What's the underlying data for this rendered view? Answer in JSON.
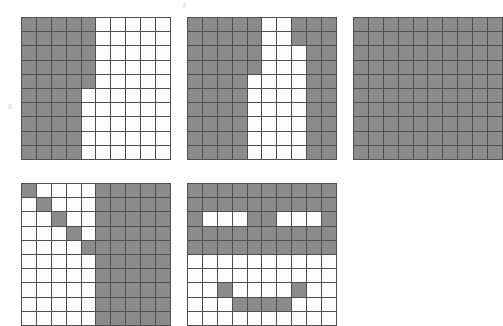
{
  "figure": {
    "background_color": "#ffffff",
    "filled_color": "#8b8b8b",
    "empty_color": "#fdfdfd",
    "gridline_color": "#4f4f4f",
    "grid_count": 5,
    "rows": 10,
    "cols": 10
  },
  "grids": [
    {
      "id": "grid-1",
      "name": "grid-top-left",
      "label": "Grid 1",
      "rows": 10,
      "cols": 10,
      "clipped": false,
      "position": {
        "left": 21,
        "top": 17,
        "width": 150,
        "height": 143
      },
      "cells": [
        [
          1,
          1,
          1,
          1,
          1,
          0,
          0,
          0,
          0,
          0
        ],
        [
          1,
          1,
          1,
          1,
          1,
          0,
          0,
          0,
          0,
          0
        ],
        [
          1,
          1,
          1,
          1,
          1,
          0,
          0,
          0,
          0,
          0
        ],
        [
          1,
          1,
          1,
          1,
          1,
          0,
          0,
          0,
          0,
          0
        ],
        [
          1,
          1,
          1,
          1,
          1,
          0,
          0,
          0,
          0,
          0
        ],
        [
          1,
          1,
          1,
          1,
          0,
          0,
          0,
          0,
          0,
          0
        ],
        [
          1,
          1,
          1,
          1,
          0,
          0,
          0,
          0,
          0,
          0
        ],
        [
          1,
          1,
          1,
          1,
          0,
          0,
          0,
          0,
          0,
          0
        ],
        [
          1,
          1,
          1,
          1,
          0,
          0,
          0,
          0,
          0,
          0
        ],
        [
          1,
          1,
          1,
          1,
          0,
          0,
          0,
          0,
          0,
          0
        ]
      ]
    },
    {
      "id": "grid-2",
      "name": "grid-top-middle",
      "label": "Grid 2",
      "rows": 10,
      "cols": 10,
      "clipped": false,
      "position": {
        "left": 187,
        "top": 17,
        "width": 150,
        "height": 143
      },
      "cells": [
        [
          1,
          1,
          1,
          1,
          1,
          0,
          0,
          1,
          1,
          1
        ],
        [
          1,
          1,
          1,
          1,
          1,
          0,
          0,
          1,
          1,
          1
        ],
        [
          1,
          1,
          1,
          1,
          1,
          0,
          0,
          0,
          1,
          1
        ],
        [
          1,
          1,
          1,
          1,
          1,
          0,
          0,
          0,
          1,
          1
        ],
        [
          1,
          1,
          1,
          1,
          0,
          0,
          0,
          0,
          1,
          1
        ],
        [
          1,
          1,
          1,
          1,
          0,
          0,
          0,
          0,
          1,
          1
        ],
        [
          1,
          1,
          1,
          1,
          0,
          0,
          0,
          0,
          1,
          1
        ],
        [
          1,
          1,
          1,
          1,
          0,
          0,
          0,
          0,
          1,
          1
        ],
        [
          1,
          1,
          1,
          1,
          0,
          0,
          0,
          0,
          1,
          1
        ],
        [
          1,
          1,
          1,
          1,
          0,
          0,
          0,
          0,
          1,
          1
        ]
      ]
    },
    {
      "id": "grid-3",
      "name": "grid-top-right",
      "label": "Grid 3",
      "rows": 10,
      "cols": 10,
      "clipped": true,
      "position": {
        "left": 353,
        "top": 17,
        "width": 150,
        "height": 143
      },
      "cells": [
        [
          1,
          1,
          1,
          1,
          1,
          1,
          1,
          1,
          1,
          1
        ],
        [
          1,
          1,
          1,
          1,
          1,
          1,
          1,
          1,
          1,
          1
        ],
        [
          1,
          1,
          1,
          1,
          1,
          1,
          1,
          1,
          1,
          1
        ],
        [
          1,
          1,
          1,
          1,
          1,
          1,
          1,
          1,
          1,
          1
        ],
        [
          1,
          1,
          1,
          1,
          1,
          1,
          1,
          1,
          1,
          1
        ],
        [
          1,
          1,
          1,
          1,
          1,
          1,
          1,
          1,
          1,
          1
        ],
        [
          1,
          1,
          1,
          1,
          1,
          1,
          1,
          1,
          1,
          1
        ],
        [
          1,
          1,
          1,
          1,
          1,
          1,
          1,
          1,
          1,
          1
        ],
        [
          1,
          1,
          1,
          1,
          1,
          1,
          1,
          1,
          1,
          1
        ],
        [
          1,
          1,
          1,
          1,
          1,
          1,
          1,
          1,
          1,
          1
        ]
      ]
    },
    {
      "id": "grid-4",
      "name": "grid-bottom-left",
      "label": "Grid 4",
      "rows": 10,
      "cols": 10,
      "clipped": false,
      "position": {
        "left": 21,
        "top": 183,
        "width": 150,
        "height": 143
      },
      "cells": [
        [
          1,
          0,
          0,
          0,
          0,
          1,
          1,
          1,
          1,
          1
        ],
        [
          0,
          1,
          0,
          0,
          0,
          1,
          1,
          1,
          1,
          1
        ],
        [
          0,
          0,
          1,
          0,
          0,
          1,
          1,
          1,
          1,
          1
        ],
        [
          0,
          0,
          0,
          1,
          0,
          1,
          1,
          1,
          1,
          1
        ],
        [
          0,
          0,
          0,
          0,
          1,
          1,
          1,
          1,
          1,
          1
        ],
        [
          0,
          0,
          0,
          0,
          0,
          1,
          1,
          1,
          1,
          1
        ],
        [
          0,
          0,
          0,
          0,
          0,
          1,
          1,
          1,
          1,
          1
        ],
        [
          0,
          0,
          0,
          0,
          0,
          1,
          1,
          1,
          1,
          1
        ],
        [
          0,
          0,
          0,
          0,
          0,
          1,
          1,
          1,
          1,
          1
        ],
        [
          0,
          0,
          0,
          0,
          0,
          1,
          1,
          1,
          1,
          1
        ]
      ]
    },
    {
      "id": "grid-5",
      "name": "grid-bottom-middle",
      "label": "Grid 5",
      "rows": 10,
      "cols": 10,
      "clipped": false,
      "position": {
        "left": 187,
        "top": 183,
        "width": 150,
        "height": 143
      },
      "cells": [
        [
          1,
          1,
          1,
          1,
          1,
          1,
          1,
          1,
          1,
          1
        ],
        [
          1,
          1,
          1,
          1,
          1,
          1,
          1,
          1,
          1,
          1
        ],
        [
          1,
          0,
          0,
          0,
          1,
          1,
          0,
          0,
          0,
          1
        ],
        [
          1,
          1,
          1,
          1,
          1,
          1,
          1,
          1,
          1,
          1
        ],
        [
          1,
          1,
          1,
          1,
          1,
          1,
          1,
          1,
          1,
          1
        ],
        [
          0,
          0,
          0,
          0,
          0,
          0,
          0,
          0,
          0,
          0
        ],
        [
          0,
          0,
          0,
          0,
          0,
          0,
          0,
          0,
          0,
          0
        ],
        [
          0,
          0,
          1,
          0,
          0,
          0,
          0,
          1,
          0,
          0
        ],
        [
          0,
          0,
          0,
          1,
          1,
          1,
          1,
          0,
          0,
          0
        ],
        [
          0,
          0,
          0,
          0,
          0,
          0,
          0,
          0,
          0,
          0
        ]
      ]
    }
  ]
}
